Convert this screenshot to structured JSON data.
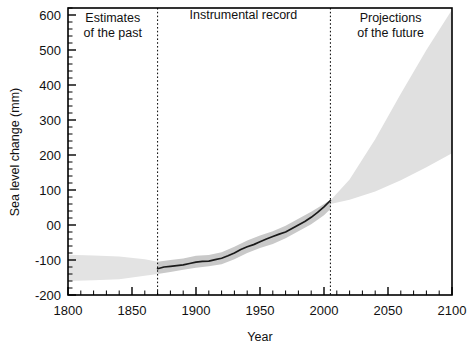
{
  "chart_data": {
    "type": "area",
    "title": "",
    "xlabel": "Year",
    "ylabel": "Sea level change (mm)",
    "xlim": [
      1800,
      2100
    ],
    "ylim": [
      -200,
      620
    ],
    "x_major_ticks": [
      1800,
      1850,
      1900,
      1950,
      2000,
      2050,
      2100
    ],
    "x_major_tick_labels": [
      "1800",
      "1850",
      "1900",
      "1950",
      "2000",
      "2050",
      "2100"
    ],
    "x_minor_tick_step": 10,
    "y_major_ticks": [
      -200,
      -100,
      0,
      100,
      200,
      300,
      400,
      500,
      600
    ],
    "y_major_tick_labels": [
      "-200",
      "-100",
      "00",
      "100",
      "200",
      "300",
      "400",
      "500",
      "600"
    ],
    "y_minor_tick_step": 20,
    "grid": false,
    "legend_position": "none",
    "annotations": [
      {
        "text": "Estimates\nof the past",
        "x": 1835,
        "y": 580,
        "lines": [
          "Estimates",
          "of the past"
        ]
      },
      {
        "text": "Instrumental record",
        "x": 1937,
        "y": 590,
        "lines": [
          "Instrumental record"
        ]
      },
      {
        "text": "Projections\nof the future",
        "x": 2052,
        "y": 580,
        "lines": [
          "Projections",
          "of the future"
        ]
      }
    ],
    "dividers": [
      {
        "x": 1870,
        "style": "dotted"
      },
      {
        "x": 2005,
        "style": "dotted"
      }
    ],
    "series": [
      {
        "name": "Estimates of the past (uncertainty band)",
        "type": "band",
        "shade": "#e3e3e3",
        "x": [
          1800,
          1820,
          1840,
          1860,
          1870
        ],
        "upper": [
          -85,
          -87,
          -90,
          -98,
          -105
        ],
        "lower": [
          -160,
          -158,
          -155,
          -145,
          -140
        ]
      },
      {
        "name": "Instrumental record (uncertainty band)",
        "type": "band",
        "shade": "#c9c9c9",
        "x": [
          1870,
          1880,
          1890,
          1900,
          1910,
          1920,
          1930,
          1940,
          1950,
          1960,
          1970,
          1980,
          1990,
          2000,
          2005
        ],
        "upper": [
          -105,
          -100,
          -96,
          -88,
          -86,
          -78,
          -62,
          -44,
          -30,
          -18,
          -2,
          18,
          38,
          60,
          72
        ],
        "lower": [
          -140,
          -134,
          -128,
          -122,
          -118,
          -112,
          -98,
          -80,
          -66,
          -54,
          -38,
          -18,
          2,
          28,
          46
        ]
      },
      {
        "name": "Instrumental record (observed sea level)",
        "type": "line",
        "color": "#1a1a1a",
        "x": [
          1870,
          1875,
          1880,
          1885,
          1890,
          1895,
          1900,
          1905,
          1910,
          1915,
          1920,
          1925,
          1930,
          1935,
          1940,
          1945,
          1950,
          1955,
          1960,
          1965,
          1970,
          1975,
          1980,
          1985,
          1990,
          1995,
          2000,
          2005
        ],
        "y": [
          -125,
          -120,
          -118,
          -116,
          -114,
          -110,
          -106,
          -104,
          -103,
          -99,
          -95,
          -88,
          -80,
          -70,
          -62,
          -56,
          -48,
          -40,
          -33,
          -26,
          -20,
          -10,
          0,
          10,
          22,
          36,
          52,
          70
        ]
      },
      {
        "name": "Projections of the future (range)",
        "type": "band",
        "shade": "#e0e0e0",
        "x": [
          2005,
          2020,
          2040,
          2060,
          2080,
          2100
        ],
        "upper": [
          70,
          130,
          245,
          375,
          500,
          615
        ],
        "lower": [
          60,
          72,
          96,
          128,
          165,
          205
        ]
      }
    ]
  },
  "figure": {
    "background_color": "#ffffff",
    "axis_color": "#000000",
    "text_color": "#1a1a1a"
  }
}
